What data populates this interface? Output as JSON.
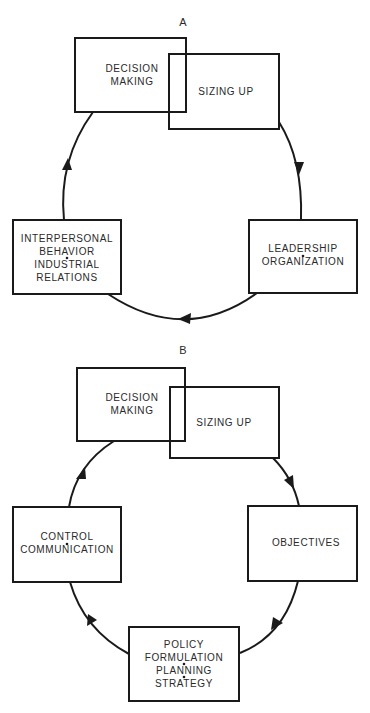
{
  "diagram_a": {
    "label": "A",
    "boxes": {
      "decision_making": [
        "DECISION",
        "MAKING"
      ],
      "sizing_up": [
        "SIZING UP"
      ],
      "leadership": [
        "LEADERSHIP",
        "ORGANIZATION"
      ],
      "interpersonal": [
        "INTERPERSONAL",
        "BEHAVIOR",
        "INDUSTRIAL",
        "RELATIONS"
      ]
    },
    "cycle_order": [
      "Decision Making",
      "Sizing Up",
      "Leadership / Organization",
      "Interpersonal Behavior / Industrial Relations"
    ]
  },
  "diagram_b": {
    "label": "B",
    "boxes": {
      "decision_making": [
        "DECISION",
        "MAKING"
      ],
      "sizing_up": [
        "SIZING UP"
      ],
      "objectives": [
        "OBJECTIVES"
      ],
      "policy": [
        "POLICY",
        "FORMULATION",
        "PLANNING",
        "STRATEGY"
      ],
      "control": [
        "CONTROL",
        "COMMUNICATION"
      ]
    },
    "cycle_order": [
      "Decision Making",
      "Sizing Up",
      "Objectives",
      "Policy Formulation / Planning / Strategy",
      "Control / Communication"
    ]
  },
  "colors": {
    "line": "#1a1a1a",
    "text": "#2a2a2a",
    "background": "#ffffff"
  }
}
